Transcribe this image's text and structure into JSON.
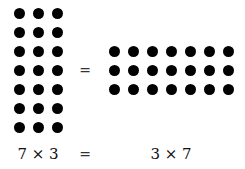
{
  "diagram": {
    "left_array": {
      "rows": 7,
      "cols": 3,
      "x0": 19,
      "y0": 13,
      "spacing": 19
    },
    "right_array": {
      "rows": 3,
      "cols": 7,
      "x0": 114,
      "y0": 51,
      "spacing": 19
    },
    "equals_sign": "=",
    "labels": {
      "left": "7 × 3",
      "equals": "=",
      "right": "3 × 7"
    },
    "dot_color": "#000000"
  }
}
